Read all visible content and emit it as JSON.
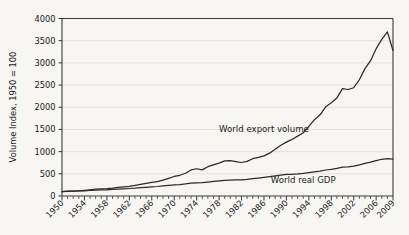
{
  "chart_data": {
    "type": "line",
    "title": "",
    "xlabel": "",
    "ylabel": "Volume Index, 1950 = 100",
    "ylim": [
      0,
      4000
    ],
    "xlim": [
      1950,
      2009
    ],
    "ytick_step": 500,
    "yticks": [
      "0",
      "500",
      "1000",
      "1500",
      "2000",
      "2500",
      "3000",
      "3500",
      "4000"
    ],
    "xticks": [
      "1950",
      "1954",
      "1958",
      "1962",
      "1966",
      "1970",
      "1974",
      "1978",
      "1982",
      "1986",
      "1990",
      "1994",
      "1998",
      "2002",
      "2006",
      "2009"
    ],
    "xtick_values": [
      1950,
      1954,
      1958,
      1962,
      1966,
      1970,
      1974,
      1978,
      1982,
      1986,
      1990,
      1994,
      1998,
      2002,
      2006,
      2009
    ],
    "minor_tick_interval": 1,
    "grid": true,
    "grid_orientation": "horizontal",
    "legend_position": "inline-annotation",
    "line_color": "#2b2b2b",
    "grid_color": "#e2e0dc",
    "background_color": "#f7f6f3",
    "x": [
      1950,
      1951,
      1952,
      1953,
      1954,
      1955,
      1956,
      1957,
      1958,
      1959,
      1960,
      1961,
      1962,
      1963,
      1964,
      1965,
      1966,
      1967,
      1968,
      1969,
      1970,
      1971,
      1972,
      1973,
      1974,
      1975,
      1976,
      1977,
      1978,
      1979,
      1980,
      1981,
      1982,
      1983,
      1984,
      1985,
      1986,
      1987,
      1988,
      1989,
      1990,
      1991,
      1992,
      1993,
      1994,
      1995,
      1996,
      1997,
      1998,
      1999,
      2000,
      2001,
      2002,
      2003,
      2004,
      2005,
      2006,
      2007,
      2008,
      2009
    ],
    "series": [
      {
        "name": "World export volume",
        "label": "World export volume",
        "label_x": 1986,
        "label_y": 1450,
        "values": [
          100,
          108,
          110,
          117,
          127,
          139,
          153,
          163,
          166,
          177,
          196,
          207,
          219,
          238,
          264,
          285,
          307,
          325,
          357,
          398,
          440,
          467,
          512,
          587,
          614,
          589,
          660,
          700,
          740,
          790,
          795,
          775,
          755,
          780,
          840,
          870,
          905,
          965,
          1055,
          1145,
          1215,
          1275,
          1350,
          1425,
          1570,
          1720,
          1830,
          2010,
          2100,
          2210,
          2420,
          2400,
          2440,
          2620,
          2870,
          3050,
          3320,
          3530,
          3700,
          3280
        ]
      },
      {
        "name": "World real GDP",
        "label": "World real GDP",
        "label_x": 1993,
        "label_y": 300,
        "values": [
          100,
          105,
          109,
          114,
          118,
          125,
          131,
          136,
          140,
          147,
          155,
          161,
          169,
          177,
          188,
          197,
          207,
          214,
          226,
          238,
          250,
          259,
          272,
          290,
          298,
          300,
          315,
          327,
          341,
          354,
          359,
          364,
          364,
          375,
          391,
          405,
          420,
          437,
          456,
          473,
          486,
          489,
          496,
          508,
          527,
          544,
          563,
          586,
          600,
          622,
          650,
          659,
          673,
          700,
          733,
          763,
          797,
          828,
          840,
          833
        ]
      }
    ]
  },
  "annotations": {
    "y_axis_title": "Volume Index, 1950 = 100"
  }
}
